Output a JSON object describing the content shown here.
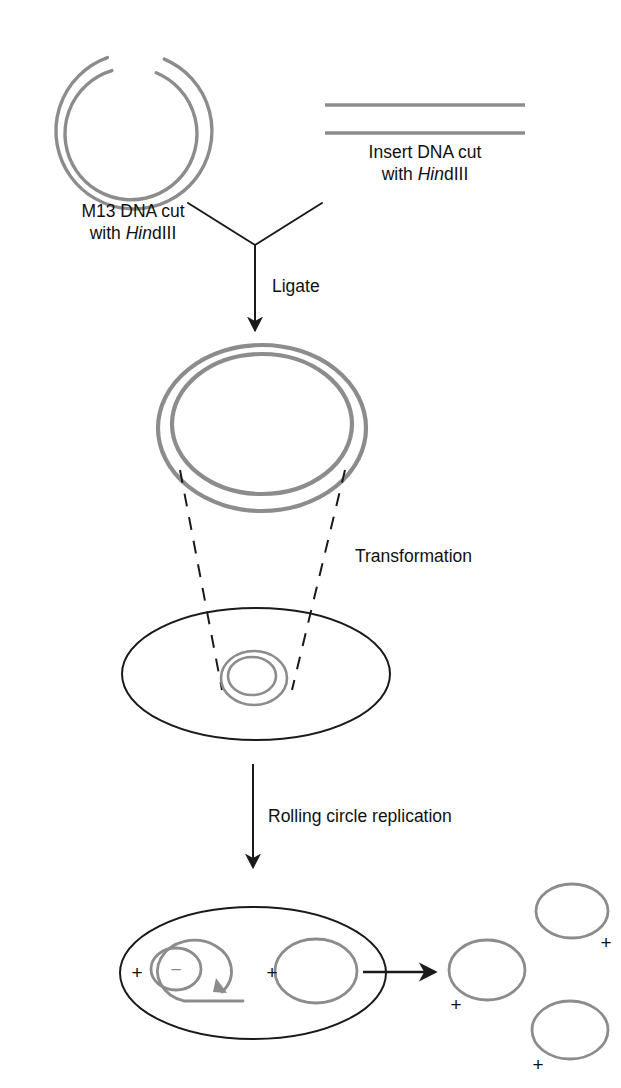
{
  "figure": {
    "colors": {
      "dna_gray": "#8c8c8c",
      "outline_black": "#1a1a1a",
      "background": "#ffffff",
      "text": "#111111"
    }
  },
  "labels": {
    "m13_line1": "M13 DNA cut",
    "m13_line2_italic": "Hin",
    "m13_line2_rest": "dIII",
    "m13_line2_prefix": "with ",
    "insert_line1": "Insert DNA cut",
    "insert_line2_prefix": "with ",
    "insert_line2_italic": "Hin",
    "insert_line2_rest": "dIII",
    "ligate": "Ligate",
    "transformation": "Transformation",
    "rolling_circle": "Rolling circle replication"
  },
  "strand_signs": {
    "cell_left_plus": "+",
    "cell_inner_minus": "−",
    "cell_right_plus": "+",
    "cell_right_edge_minus": "−",
    "released_left_plus": "+",
    "released_topright_plus": "+",
    "released_bottomright_plus": "+"
  },
  "shapes": {
    "m13_circle": {
      "name": "M13 DNA open circle cut with HindIII",
      "cx": 133,
      "cy": 133,
      "outer_r": 78,
      "inner_r": 66,
      "gap_top_degrees": 26
    },
    "insert_dna": {
      "name": "Linear insert DNA duplex",
      "x1": 325,
      "x2": 525,
      "y_top": 105,
      "y_bottom": 133
    },
    "ligated_plasmid": {
      "name": "Ligated recombinant M13 double-stranded circle",
      "cx": 262,
      "cy": 428,
      "outer_rx": 104,
      "outer_ry": 83,
      "inner_rx": 90,
      "inner_ry": 70
    },
    "transformed_cell": {
      "name": "Bacterial cell after transformation",
      "cx": 256,
      "cy": 674,
      "rx": 134,
      "ry": 66
    },
    "cell_plasmid": {
      "cx": 254,
      "cy": 678,
      "outer_rx": 33,
      "outer_ry": 27,
      "inner_rx": 24,
      "inner_ry": 19
    },
    "replicating_cell": {
      "name": "Bacterial cell undergoing rolling circle replication",
      "cx": 253,
      "cy": 973,
      "rx": 133,
      "ry": 66
    },
    "released_phage_circles": [
      {
        "cx": 487,
        "cy": 970,
        "rx": 38,
        "ry": 30
      },
      {
        "cx": 572,
        "cy": 911,
        "rx": 36,
        "ry": 27
      },
      {
        "cx": 570,
        "cy": 1030,
        "rx": 38,
        "ry": 29
      }
    ]
  },
  "arrows": {
    "ligate_arrow": {
      "left_branch": [
        188,
        203,
        255,
        245
      ],
      "right_branch": [
        322,
        203,
        255,
        245
      ],
      "stem": [
        255,
        245,
        255,
        335
      ]
    },
    "rolling_circle_arrow": {
      "stem": [
        253,
        764,
        253,
        872
      ]
    },
    "release_arrow": {
      "stem": [
        372,
        972,
        440,
        972
      ]
    }
  }
}
